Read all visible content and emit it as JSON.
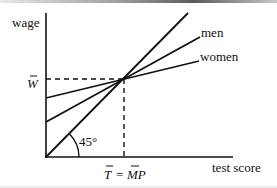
{
  "diagram": {
    "axes": {
      "y_label": "wage",
      "x_label": "test score"
    },
    "lines": [
      {
        "name": "45-degree line",
        "label": ""
      },
      {
        "name": "men",
        "label": "men"
      },
      {
        "name": "women",
        "label": "women"
      }
    ],
    "annotations": {
      "angle": "45°",
      "w_bar": "W",
      "t_bar": "T",
      "equals": "=",
      "mp_bar": "MP"
    },
    "colors": {
      "ink": "#111111",
      "background": "#ffffff"
    }
  }
}
